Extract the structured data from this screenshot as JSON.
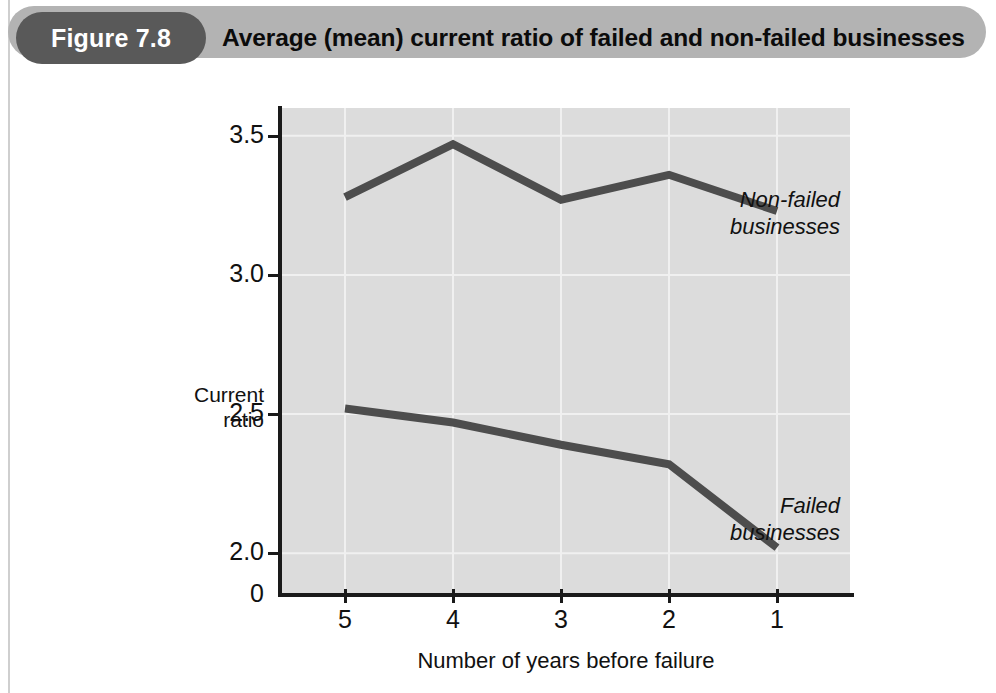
{
  "figure": {
    "badge_label": "Figure 7.8",
    "title": "Average (mean) current ratio of failed and non-failed businesses"
  },
  "chart_data": {
    "type": "line",
    "title": "Average (mean) current ratio of failed and non-failed businesses",
    "xlabel": "Number of years before failure",
    "ylabel": "Current ratio",
    "ylabel_line1": "Current",
    "ylabel_line2": "ratio",
    "categories": [
      "5",
      "4",
      "3",
      "2",
      "1"
    ],
    "x_tick_labels": [
      "5",
      "4",
      "3",
      "2",
      "1"
    ],
    "y_tick_labels": [
      "3.5",
      "3.0",
      "2.5",
      "2.0",
      "0"
    ],
    "y_tick_values": [
      3.5,
      3.0,
      2.5,
      2.0,
      0
    ],
    "ylim": [
      1.85,
      3.6
    ],
    "grid": true,
    "legend_position": "inline-right",
    "series": [
      {
        "name": "Non-failed businesses",
        "label_line1": "Non-failed",
        "label_line2": "businesses",
        "values": [
          3.28,
          3.47,
          3.27,
          3.36,
          3.23
        ],
        "color": "#4d4d4d"
      },
      {
        "name": "Failed businesses",
        "label_line1": "Failed",
        "label_line2": "businesses",
        "values": [
          2.52,
          2.47,
          2.39,
          2.32,
          2.02
        ],
        "color": "#4d4d4d"
      }
    ],
    "colors": {
      "plot_background": "#dcdcdc",
      "grid_line": "#f0f0f0",
      "axis": "#1a1a1a",
      "line": "#4d4d4d"
    }
  },
  "banner_colors": {
    "banner_background": "#b3b3b3",
    "badge_background": "#595959",
    "badge_text": "#ffffff",
    "title_text": "#0b0b0b"
  }
}
